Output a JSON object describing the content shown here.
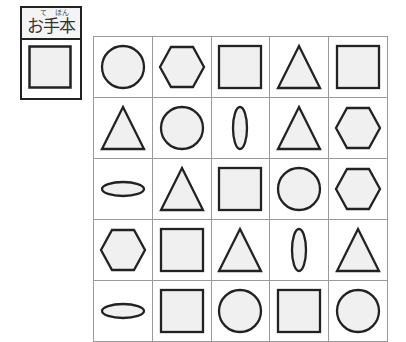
{
  "model": {
    "label": "お手本",
    "ruby_te": "て",
    "ruby_hon": "ほん",
    "shape": "square"
  },
  "colors": {
    "stroke": "#222222",
    "fill": "#f0f0f0",
    "grid_line": "#9a9a9a"
  },
  "grid": {
    "rows": [
      [
        "circle",
        "hexagon",
        "square",
        "triangle",
        "square"
      ],
      [
        "triangle",
        "circle",
        "ellipse-vertical",
        "triangle",
        "hexagon"
      ],
      [
        "ellipse-horizontal",
        "triangle",
        "square",
        "circle",
        "hexagon"
      ],
      [
        "hexagon",
        "square",
        "triangle",
        "ellipse-vertical",
        "triangle"
      ],
      [
        "ellipse-horizontal",
        "square",
        "circle",
        "square",
        "circle"
      ]
    ]
  }
}
